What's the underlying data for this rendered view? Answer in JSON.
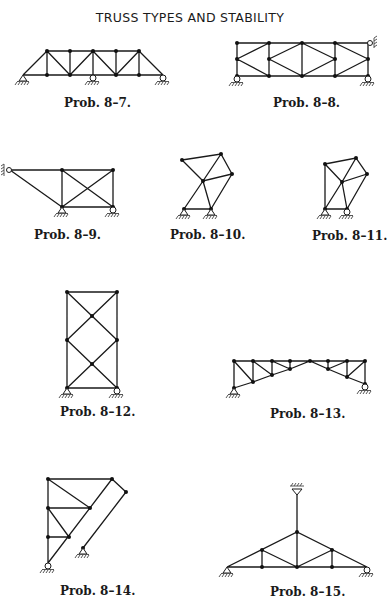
{
  "page": {
    "title": "TRUSS TYPES AND STABILITY"
  },
  "figures": [
    {
      "id": "8-7",
      "caption": "Prob. 8–7."
    },
    {
      "id": "8-8",
      "caption": "Prob. 8–8."
    },
    {
      "id": "8-9",
      "caption": "Prob. 8–9."
    },
    {
      "id": "8-10",
      "caption": "Prob. 8–10."
    },
    {
      "id": "8-11",
      "caption": "Prob. 8–11."
    },
    {
      "id": "8-12",
      "caption": "Prob. 8–12."
    },
    {
      "id": "8-13",
      "caption": "Prob. 8–13."
    },
    {
      "id": "8-14",
      "caption": "Prob. 8–14."
    },
    {
      "id": "8-15",
      "caption": "Prob. 8–15."
    }
  ],
  "colors": {
    "line": "#1a1a1a",
    "background": "#ffffff"
  }
}
